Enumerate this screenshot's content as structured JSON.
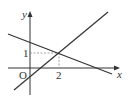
{
  "diagram": {
    "type": "coordinate-graph",
    "axes": {
      "x_label": "x",
      "y_label": "y",
      "origin_label": "O"
    },
    "ticks": {
      "x_tick": "2",
      "y_tick": "1"
    },
    "intersection_point": {
      "x": 2,
      "y": 1
    },
    "lines": [
      {
        "name": "increasing-line",
        "slope_sign": "positive",
        "y_intercept_sign": "negative"
      },
      {
        "name": "decreasing-line",
        "slope_sign": "negative",
        "y_intercept_sign": "positive"
      }
    ],
    "colors": {
      "stroke": "#333333",
      "dashed": "#888888"
    }
  }
}
